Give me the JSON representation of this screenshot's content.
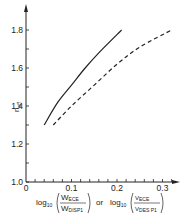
{
  "chart_data": {
    "type": "line",
    "title": "",
    "xlabel": "log10(W_ECE / W_DISP1) or log10(V_ECE / V_DES P1)",
    "ylabel": "n_eff",
    "xlim": [
      0,
      0.32
    ],
    "ylim": [
      1.0,
      1.9
    ],
    "x_ticks": [
      "0",
      "0.1",
      "0.2",
      "0.3"
    ],
    "y_ticks": [
      "1.0",
      "1.2",
      "1.4",
      "1.6",
      "1.8"
    ],
    "grid": false,
    "legend": null,
    "series": [
      {
        "name": "log10(W_ECE / W_DISP1)",
        "style": "solid",
        "x": [
          0.04,
          0.07,
          0.1,
          0.13,
          0.16,
          0.21
        ],
        "y": [
          1.3,
          1.42,
          1.51,
          1.6,
          1.68,
          1.8
        ]
      },
      {
        "name": "log10(V_ECE / V_DES P1)",
        "style": "dashed",
        "x": [
          0.06,
          0.1,
          0.15,
          0.2,
          0.25,
          0.32
        ],
        "y": [
          1.3,
          1.4,
          1.51,
          1.62,
          1.71,
          1.8
        ]
      }
    ]
  },
  "labels": {
    "y_axis": "n",
    "y_axis_sub": "eff",
    "x_log": "log",
    "x_log_sub": "10",
    "x_num1": "W",
    "x_num1_sub": "ECE",
    "x_den1": "W",
    "x_den1_sub": "DISP1",
    "x_or": "or",
    "x_num2": "V",
    "x_num2_sub": "ECE",
    "x_den2": "V",
    "x_den2_sub": "DES P1"
  },
  "colors": {
    "ink": "#222222",
    "background": "#ffffff"
  }
}
